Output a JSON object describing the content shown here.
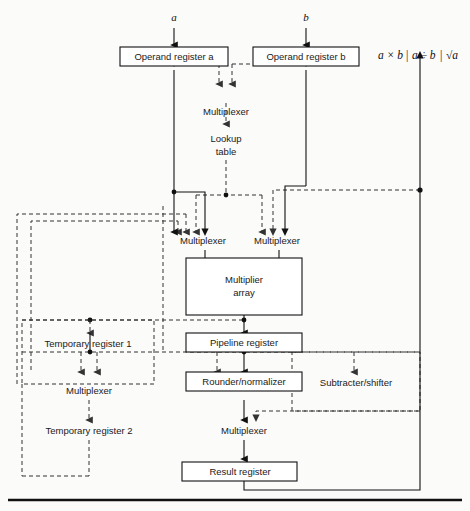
{
  "figure": {
    "width": 470,
    "height": 511,
    "colors": {
      "stroke_solid": "#111111",
      "stroke_dashed": "#333333",
      "box_fill": "#ffffff",
      "background": "#fbfbfa"
    }
  },
  "inputs": {
    "operand_a": "a",
    "operand_b": "b"
  },
  "output_expression": {
    "term1": "a × b",
    "separator1": "|",
    "term2": "a ÷ b",
    "separator2": "|",
    "term3": "√a",
    "full": "a × b | a ÷ b | √a"
  },
  "blocks": [
    {
      "id": "operand-register-a",
      "label": "Operand register a",
      "kind": "solid-box"
    },
    {
      "id": "operand-register-b",
      "label": "Operand register b",
      "kind": "solid-box"
    },
    {
      "id": "multiplexer-lookup",
      "label": "Multiplexer",
      "kind": "free-text"
    },
    {
      "id": "lookup-table",
      "label": "Lookup",
      "label2": "table",
      "kind": "free-text"
    },
    {
      "id": "multiplexer-left",
      "label": "Multiplexer",
      "kind": "free-text"
    },
    {
      "id": "multiplexer-right",
      "label": "Multiplexer",
      "kind": "free-text"
    },
    {
      "id": "multiplier-array",
      "label": "Multiplier",
      "label2": "array",
      "kind": "solid-box"
    },
    {
      "id": "temporary-register-1",
      "label": "Temporary register 1",
      "kind": "dashed-box"
    },
    {
      "id": "pipeline-register",
      "label": "Pipeline register",
      "kind": "solid-box"
    },
    {
      "id": "multiplexer-temp",
      "label": "Multiplexer",
      "kind": "free-text"
    },
    {
      "id": "rounder-normalizer",
      "label": "Rounder/normalizer",
      "kind": "solid-box"
    },
    {
      "id": "subtracter-shifter",
      "label": "Subtracter/shifter",
      "kind": "dashed-box"
    },
    {
      "id": "temporary-register-2",
      "label": "Temporary register 2",
      "kind": "free-text"
    },
    {
      "id": "multiplexer-result",
      "label": "Multiplexer",
      "kind": "free-text"
    },
    {
      "id": "result-register",
      "label": "Result register",
      "kind": "solid-box"
    }
  ],
  "legend": {
    "solid_meaning": "primary multiply datapath",
    "dashed_meaning": "divide / square-root datapath"
  }
}
